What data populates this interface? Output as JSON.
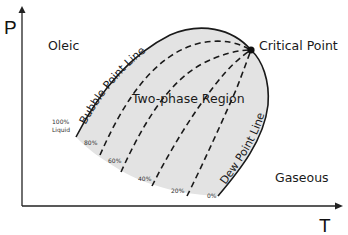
{
  "diagram": {
    "type": "pressure-temperature phase envelope",
    "axes": {
      "y_label": "P",
      "x_label": "T"
    },
    "regions": {
      "oleic": "Oleic",
      "gaseous": "Gaseous",
      "two_phase": "Two-phase Region"
    },
    "curves": {
      "bubble_point": "Bubble Point Line",
      "dew_point": "Dew Point Line"
    },
    "critical_point": "Critical Point",
    "quality_lines": [
      {
        "label": "100%",
        "sublabel": "Liquid"
      },
      {
        "label": "80%"
      },
      {
        "label": "60%"
      },
      {
        "label": "40%"
      },
      {
        "label": "20%"
      },
      {
        "label": "0%"
      }
    ],
    "colors": {
      "envelope_fill": "#e3e3e3",
      "line": "#1a1a1a"
    }
  }
}
